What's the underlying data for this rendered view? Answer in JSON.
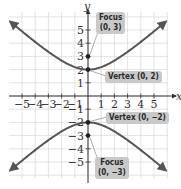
{
  "chart_data": {
    "type": "line",
    "title": "",
    "xlabel": "x",
    "ylabel": "y",
    "xlim": [
      -6,
      6
    ],
    "ylim": [
      -6,
      6
    ],
    "grid": true,
    "x_ticks": [
      "-5",
      "-4",
      "-3",
      "-2",
      "-1",
      "1",
      "2",
      "3",
      "4",
      "5"
    ],
    "y_ticks": [
      "5",
      "4",
      "3",
      "2",
      "1",
      "-1",
      "-2",
      "-3",
      "-4",
      "-5"
    ],
    "series": [
      {
        "name": "upper branch",
        "equation": "y = 2*sqrt(1 + x^2/5)",
        "points": [
          [
            -6,
            5.7
          ],
          [
            -4,
            3.59
          ],
          [
            -2,
            2.37
          ],
          [
            0,
            2
          ],
          [
            2,
            2.37
          ],
          [
            4,
            3.59
          ],
          [
            6,
            5.7
          ]
        ]
      },
      {
        "name": "lower branch",
        "equation": "y = -2*sqrt(1 + x^2/5)",
        "points": [
          [
            -6,
            -5.7
          ],
          [
            -4,
            -3.59
          ],
          [
            -2,
            -2.37
          ],
          [
            0,
            -2
          ],
          [
            2,
            -2.37
          ],
          [
            4,
            -3.59
          ],
          [
            6,
            -5.7
          ]
        ]
      }
    ],
    "points": [
      {
        "label": "Focus (0, 3)",
        "x": 0,
        "y": 3
      },
      {
        "label": "Vertex (0, 2)",
        "x": 0,
        "y": 2
      },
      {
        "label": "Vertex (0, −2)",
        "x": 0,
        "y": -2
      },
      {
        "label": "Focus (0, −3)",
        "x": 0,
        "y": -3
      }
    ]
  },
  "labels": {
    "focus_top_line1": "Focus",
    "focus_top_line2": "(0, 3)",
    "vertex_top": "Vertex (0, 2)",
    "vertex_bottom": "Vertex (0, −2)",
    "focus_bottom_line1": "Focus",
    "focus_bottom_line2": "(0, −3)",
    "x_axis": "x",
    "y_axis": "y"
  },
  "colors": {
    "curve": "#555555",
    "grid": "#dcdcdc",
    "callout_bg": "#c9c9c9"
  }
}
